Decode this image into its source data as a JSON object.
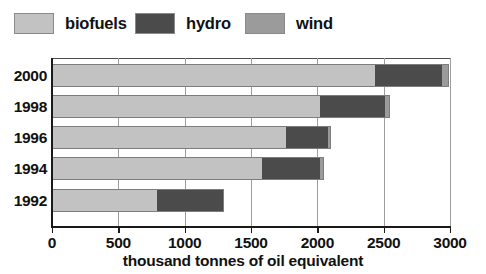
{
  "chart_data": {
    "type": "bar",
    "orientation": "horizontal",
    "stacked": true,
    "title": "",
    "xlabel": "thousand tonnes of oil equivalent",
    "ylabel": "",
    "categories": [
      "2000",
      "1998",
      "1996",
      "1994",
      "1992"
    ],
    "xlim": [
      0,
      3000
    ],
    "xticks": [
      0,
      500,
      1000,
      1500,
      2000,
      2500,
      3000
    ],
    "xtick_labels": [
      "0",
      "500",
      "1000",
      "1500",
      "2000",
      "2500",
      "3000"
    ],
    "grid": true,
    "grid_axis": "x",
    "legend_position": "top-left",
    "series": [
      {
        "name": "biofuels",
        "color": "#c2c2c2",
        "values": [
          2435,
          2020,
          1765,
          1580,
          790
        ]
      },
      {
        "name": "hydro",
        "color": "#4b4b4b",
        "values": [
          505,
          490,
          315,
          440,
          505
        ]
      },
      {
        "name": "wind",
        "color": "#9b9b9b",
        "values": [
          55,
          40,
          25,
          30,
          0
        ]
      }
    ],
    "totals": [
      2995,
      2550,
      2105,
      2050,
      1295
    ]
  },
  "legend": {
    "items": [
      {
        "label": "biofuels",
        "color": "#c2c2c2"
      },
      {
        "label": "hydro",
        "color": "#4b4b4b"
      },
      {
        "label": "wind",
        "color": "#9b9b9b"
      }
    ]
  },
  "axes": {
    "x_title": "thousand tonnes of oil equivalent",
    "x_tick_labels": [
      "0",
      "500",
      "1000",
      "1500",
      "2000",
      "2500",
      "3000"
    ],
    "y_tick_labels": [
      "2000",
      "1998",
      "1996",
      "1994",
      "1992"
    ]
  },
  "colors": {
    "biofuels": "#c2c2c2",
    "hydro": "#4b4b4b",
    "wind": "#9b9b9b",
    "axis": "#1a1a1a",
    "grid": "#9d9d9d",
    "background": "#ffffff",
    "text": "#111111"
  }
}
